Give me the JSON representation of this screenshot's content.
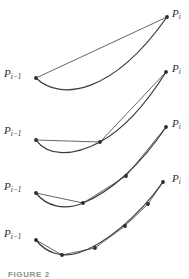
{
  "figure": {
    "caption": "FIGURE 2",
    "background_color": "#ffffff",
    "curve_color": "#3c3c3c",
    "chord_color": "#555555",
    "node_color": "#2b2b2b",
    "label_color": "#2b2b2b",
    "width": 189,
    "height": 279,
    "stages": [
      {
        "index": 1,
        "start_label": "P",
        "start_sub": "i−1",
        "end_label": "P",
        "end_sub": "i",
        "start_label_pos": [
          4,
          68
        ],
        "end_label_pos": [
          172,
          8
        ],
        "start_point": [
          36,
          78
        ],
        "end_point": [
          167,
          17
        ],
        "curve_path": "M36,78 C60,101 112,95 167,17",
        "chord_path": "M36,78 L167,17",
        "interior_points": [],
        "interior_count": 0
      },
      {
        "index": 2,
        "start_label": "P",
        "start_sub": "i−1",
        "end_label": "P",
        "end_sub": "i",
        "start_label_pos": [
          4,
          125
        ],
        "end_label_pos": [
          172,
          63
        ],
        "start_point": [
          36,
          140
        ],
        "end_point": [
          166,
          72
        ],
        "curve_path": "M36,140 C48,156 72,157 100,142 C124,129 146,104 166,72",
        "chord_path": "M36,140 L100,142 L166,72",
        "interior_points": [
          [
            100,
            142
          ]
        ],
        "interior_count": 1
      },
      {
        "index": 3,
        "start_label": "P",
        "start_sub": "i−1",
        "end_label": "P",
        "end_sub": "i",
        "start_label_pos": [
          4,
          181
        ],
        "end_label_pos": [
          172,
          118
        ],
        "start_point": [
          36,
          193
        ],
        "end_point": [
          166,
          127
        ],
        "curve_path": "M36,193 C46,206 64,211 83,203 C110,192 140,166 166,127",
        "chord_path": "M36,193 L83,203 L126,176 L166,127",
        "interior_points": [
          [
            83,
            203
          ],
          [
            126,
            176
          ]
        ],
        "interior_count": 2
      },
      {
        "index": 4,
        "start_label": "P",
        "start_sub": "i−1",
        "end_label": "P",
        "end_sub": "i",
        "start_label_pos": [
          4,
          228
        ],
        "end_label_pos": [
          172,
          173
        ],
        "start_point": [
          36,
          240
        ],
        "end_point": [
          163,
          182
        ],
        "curve_path": "M36,240 C46,253 62,258 78,253 C104,245 138,217 163,182",
        "chord_path": "M36,240 L62,255 L95,248 L125,226 L148,204 L163,182",
        "interior_points": [
          [
            62,
            255
          ],
          [
            95,
            248
          ],
          [
            125,
            226
          ],
          [
            148,
            204
          ]
        ],
        "interior_count": 4
      }
    ]
  }
}
